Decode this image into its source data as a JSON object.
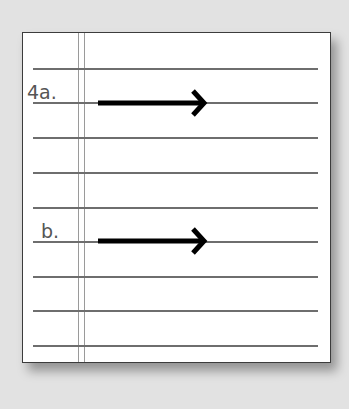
{
  "worksheet": {
    "items": [
      {
        "label": "4a.",
        "answer": "",
        "icon": "right-arrow-icon"
      },
      {
        "label": "b.",
        "answer": "",
        "icon": "right-arrow-icon"
      }
    ],
    "rule_count": 9,
    "colors": {
      "background": "#e2e2e2",
      "paper": "#ffffff",
      "rule": "#6e6e6e",
      "margin": "#9a9a9a",
      "arrow": "#000000",
      "label": "#555555"
    }
  }
}
